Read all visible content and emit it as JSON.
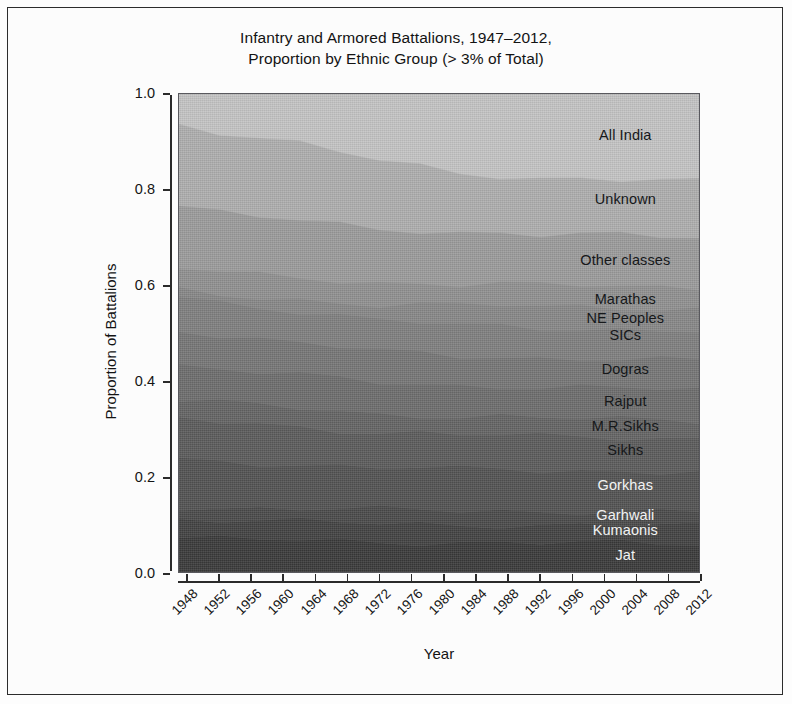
{
  "figure": {
    "title_line1": "Infantry and Armored Battalions, 1947–2012,",
    "title_line2": "Proportion by Ethnic Group (> 3% of Total)"
  },
  "axes": {
    "x_title": "Year",
    "y_title": "Proportion of Battalions",
    "y_ticks": [
      "0.0",
      "0.2",
      "0.4",
      "0.6",
      "0.8",
      "1.0"
    ],
    "x_ticks": [
      "1948",
      "1952",
      "1956",
      "1960",
      "1964",
      "1968",
      "1972",
      "1976",
      "1980",
      "1984",
      "1988",
      "1992",
      "1996",
      "2000",
      "2004",
      "2008",
      "2012"
    ]
  },
  "chart_data": {
    "type": "area",
    "title": "Infantry and Armored Battalions, 1947–2012, Proportion by Ethnic Group (> 3% of Total)",
    "subtitle": "",
    "xlabel": "Year",
    "ylabel": "Proportion of Battalions",
    "xlim": [
      1947,
      2012
    ],
    "ylim": [
      0.0,
      1.0
    ],
    "grid": false,
    "legend_position": "inline-right-labels",
    "stacked": true,
    "normalized": true,
    "x": [
      1947,
      1952,
      1957,
      1962,
      1967,
      1972,
      1977,
      1982,
      1987,
      1992,
      1997,
      2002,
      2007,
      2012
    ],
    "series": [
      {
        "name": "Jat",
        "fill": "#3a3a3a",
        "text_color": "light",
        "label_y": 0.04,
        "values": [
          0.075,
          0.073,
          0.072,
          0.07,
          0.069,
          0.068,
          0.067,
          0.066,
          0.066,
          0.065,
          0.065,
          0.064,
          0.064,
          0.064
        ]
      },
      {
        "name": "Kumaonis",
        "fill": "#424242",
        "text_color": "light",
        "label_y": 0.092,
        "values": [
          0.04,
          0.04,
          0.039,
          0.039,
          0.038,
          0.038,
          0.038,
          0.037,
          0.037,
          0.037,
          0.037,
          0.037,
          0.037,
          0.037
        ]
      },
      {
        "name": "Garhwali",
        "fill": "#4a4a4a",
        "text_color": "light",
        "label_y": 0.122,
        "values": [
          0.025,
          0.026,
          0.027,
          0.028,
          0.028,
          0.028,
          0.029,
          0.029,
          0.029,
          0.029,
          0.029,
          0.029,
          0.029,
          0.029
        ]
      },
      {
        "name": "Gorkhas",
        "fill": "#525252",
        "text_color": "light",
        "label_y": 0.185,
        "values": [
          0.098,
          0.096,
          0.094,
          0.092,
          0.09,
          0.088,
          0.087,
          0.086,
          0.086,
          0.085,
          0.085,
          0.085,
          0.084,
          0.084
        ]
      },
      {
        "name": "Sikhs",
        "fill": "#5b5b5b",
        "text_color": "dark",
        "label_y": 0.258,
        "values": [
          0.085,
          0.082,
          0.08,
          0.078,
          0.076,
          0.074,
          0.073,
          0.072,
          0.071,
          0.071,
          0.07,
          0.07,
          0.07,
          0.069
        ]
      },
      {
        "name": "M.R.Sikhs",
        "fill": "#646464",
        "text_color": "dark",
        "label_y": 0.308,
        "values": [
          0.04,
          0.04,
          0.039,
          0.039,
          0.039,
          0.038,
          0.038,
          0.038,
          0.038,
          0.038,
          0.038,
          0.038,
          0.038,
          0.038
        ]
      },
      {
        "name": "Rajput",
        "fill": "#6d6d6d",
        "text_color": "dark",
        "label_y": 0.36,
        "values": [
          0.072,
          0.07,
          0.069,
          0.068,
          0.067,
          0.066,
          0.065,
          0.065,
          0.064,
          0.064,
          0.064,
          0.064,
          0.064,
          0.063
        ]
      },
      {
        "name": "Dogras",
        "fill": "#767676",
        "text_color": "dark",
        "label_y": 0.428,
        "values": [
          0.075,
          0.072,
          0.07,
          0.068,
          0.066,
          0.064,
          0.063,
          0.062,
          0.062,
          0.061,
          0.061,
          0.061,
          0.06,
          0.06
        ]
      },
      {
        "name": "SICs",
        "fill": "#7f7f7f",
        "text_color": "dark",
        "label_y": 0.498,
        "values": [
          0.07,
          0.068,
          0.067,
          0.066,
          0.065,
          0.064,
          0.064,
          0.063,
          0.063,
          0.063,
          0.063,
          0.062,
          0.062,
          0.062
        ]
      },
      {
        "name": "NE Peoples",
        "fill": "#878787",
        "text_color": "dark",
        "label_y": 0.534,
        "values": [
          0.01,
          0.014,
          0.019,
          0.024,
          0.029,
          0.034,
          0.038,
          0.041,
          0.043,
          0.044,
          0.045,
          0.046,
          0.046,
          0.047
        ]
      },
      {
        "name": "Marathas",
        "fill": "#909090",
        "text_color": "dark",
        "label_y": 0.572,
        "values": [
          0.048,
          0.047,
          0.046,
          0.046,
          0.045,
          0.045,
          0.045,
          0.045,
          0.044,
          0.044,
          0.044,
          0.044,
          0.044,
          0.044
        ]
      },
      {
        "name": "Other classes",
        "fill": "#9b9b9b",
        "text_color": "dark",
        "label_y": 0.655,
        "values": [
          0.13,
          0.126,
          0.122,
          0.118,
          0.115,
          0.112,
          0.11,
          0.108,
          0.107,
          0.106,
          0.106,
          0.105,
          0.105,
          0.105
        ]
      },
      {
        "name": "Unknown",
        "fill": "#aeaeae",
        "text_color": "dark",
        "label_y": 0.782,
        "values": [
          0.17,
          0.168,
          0.165,
          0.16,
          0.152,
          0.143,
          0.133,
          0.124,
          0.12,
          0.118,
          0.117,
          0.116,
          0.116,
          0.115
        ]
      },
      {
        "name": "All India",
        "fill": "#c4c4c4",
        "text_color": "dark",
        "label_y": 0.915,
        "values": [
          0.062,
          0.078,
          0.091,
          0.104,
          0.121,
          0.138,
          0.15,
          0.164,
          0.168,
          0.175,
          0.176,
          0.179,
          0.181,
          0.183
        ]
      }
    ],
    "labels_x_fraction": 0.855
  }
}
